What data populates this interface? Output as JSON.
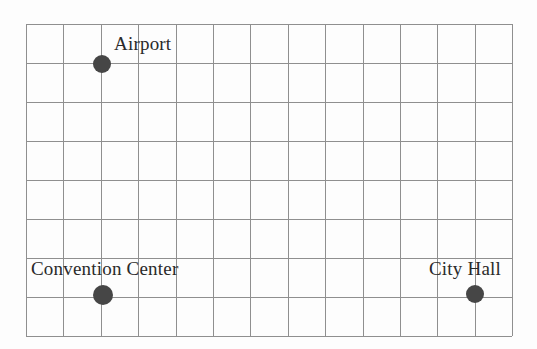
{
  "diagram": {
    "background_color": "#fdfdfd",
    "grid": {
      "line_color": "#8f8f8f",
      "columns": 13,
      "rows": 8,
      "left": 26,
      "top": 24,
      "cell_width": 37.4,
      "cell_height": 39.0
    },
    "marker_color": "#464646",
    "label_color": "#2a2a2a",
    "landmarks": [
      {
        "name": "Airport",
        "label": "Airport",
        "marker_x": 102,
        "marker_y": 64,
        "marker_diameter": 18,
        "grid_column": 2,
        "grid_row": 1,
        "label_x": 114,
        "label_y": 34,
        "label_font_size": 19
      },
      {
        "name": "Convention Center",
        "label": "Convention Center",
        "marker_x": 103,
        "marker_y": 295,
        "marker_diameter": 20,
        "grid_column": 2,
        "grid_row": 7,
        "label_x": 31,
        "label_y": 259,
        "label_font_size": 19
      },
      {
        "name": "City Hall",
        "label": "City Hall",
        "marker_x": 475,
        "marker_y": 294,
        "marker_diameter": 18,
        "grid_column": 12,
        "grid_row": 7,
        "label_x": 429,
        "label_y": 259,
        "label_font_size": 19
      }
    ]
  }
}
